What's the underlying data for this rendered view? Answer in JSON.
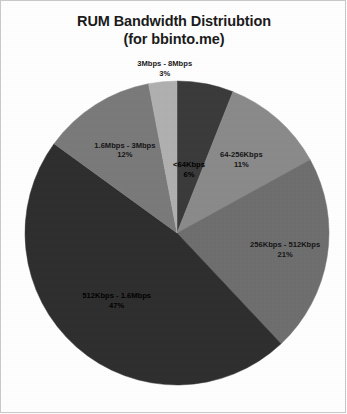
{
  "title": {
    "line1": "RUM Bandwidth Distriubtion",
    "line2": "(for bbinto.me)"
  },
  "chart_data": {
    "type": "pie",
    "title": "RUM Bandwidth Distriubtion (for bbinto.me)",
    "subtitle": "(for bbinto.me)",
    "xlabel": "",
    "ylabel": "",
    "legend": "none",
    "grid": false,
    "value_unit": "percent",
    "start_angle_deg": 0,
    "direction": "clockwise",
    "categories": [
      "<64Kbps",
      "64-256Kbps",
      "256Kbps - 512Kbps",
      "512Kbps - 1.6Mbps",
      "1.6Mbps - 3Mbps",
      "3Mbps - 8Mbps"
    ],
    "values": [
      6,
      11,
      21,
      47,
      12,
      3
    ],
    "value_labels": [
      "6%",
      "11%",
      "21%",
      "47%",
      "12%",
      "3%"
    ],
    "colors": [
      "#3a3a3a",
      "#8a8a8a",
      "#6e6e6e",
      "#2e2e2e",
      "#7a7a7a",
      "#b0b0b0"
    ],
    "slices": [
      {
        "label": "<64Kbps",
        "percent_label": "6%",
        "value": 6,
        "color": "#3a3a3a",
        "label_placement": "inside",
        "label_text_color": "#000000"
      },
      {
        "label": "64-256Kbps",
        "percent_label": "11%",
        "value": 11,
        "color": "#8a8a8a",
        "label_placement": "inside",
        "label_text_color": "#141414"
      },
      {
        "label": "256Kbps - 512Kbps",
        "percent_label": "21%",
        "value": 21,
        "color": "#6e6e6e",
        "label_placement": "inside",
        "label_text_color": "#141414"
      },
      {
        "label": "512Kbps - 1.6Mbps",
        "percent_label": "47%",
        "value": 47,
        "color": "#2e2e2e",
        "label_placement": "inside",
        "label_text_color": "#000000"
      },
      {
        "label": "1.6Mbps - 3Mbps",
        "percent_label": "12%",
        "value": 12,
        "color": "#7a7a7a",
        "label_placement": "inside",
        "label_text_color": "#141414"
      },
      {
        "label": "3Mbps - 8Mbps",
        "percent_label": "3%",
        "value": 3,
        "color": "#b0b0b0",
        "label_placement": "outside-top",
        "label_text_color": "#1a1a1a"
      }
    ]
  },
  "geometry": {
    "center_x": 176,
    "center_y": 232,
    "radius": 152
  }
}
